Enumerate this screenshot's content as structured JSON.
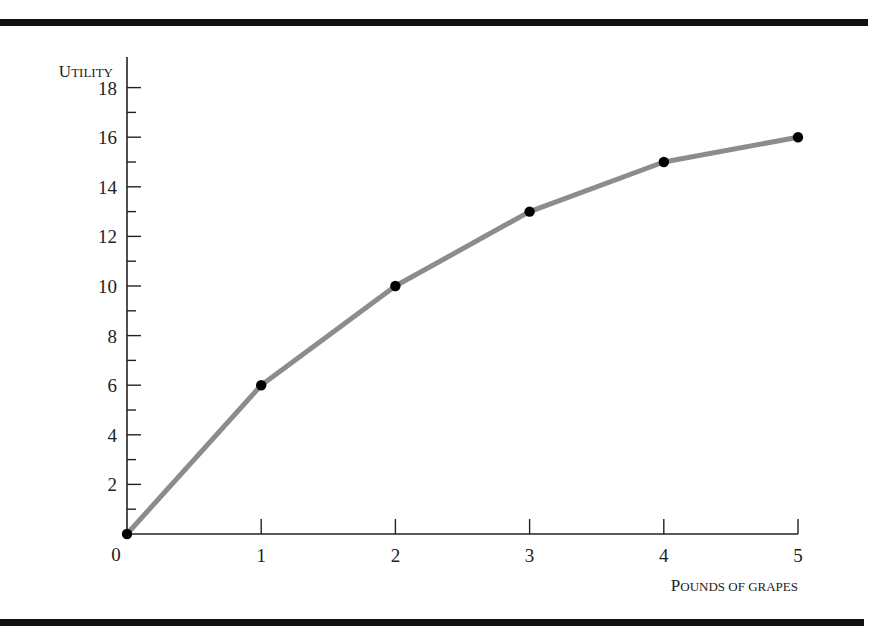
{
  "chart_data": {
    "type": "line",
    "title": "",
    "xlabel": "Pounds of grapes",
    "ylabel": "Utility",
    "x": [
      0,
      1,
      2,
      3,
      4,
      5
    ],
    "series": [
      {
        "name": "Total utility",
        "values": [
          0,
          6,
          10,
          13,
          15,
          16
        ]
      }
    ],
    "xlim": [
      0,
      5
    ],
    "ylim": [
      0,
      19
    ],
    "x_ticks": [
      "0",
      "1",
      "2",
      "3",
      "4",
      "5"
    ],
    "y_ticks": [
      "2",
      "4",
      "6",
      "8",
      "10",
      "12",
      "14",
      "16",
      "18"
    ],
    "y_minor_ticks": [
      1,
      3,
      5,
      7,
      9,
      11,
      13,
      15,
      17
    ],
    "grid": false,
    "legend": "none",
    "markers": true,
    "colors": {
      "line": "#8c8c8c",
      "marker": "#000000",
      "axis": "#222222",
      "rule": "#111111"
    }
  },
  "labels": {
    "y_axis_title_cap": "U",
    "y_axis_title_rest": "TILITY",
    "x_axis_title_cap1": "P",
    "x_axis_title_rest1": "OUNDS OF GRAPES",
    "origin": "0"
  }
}
